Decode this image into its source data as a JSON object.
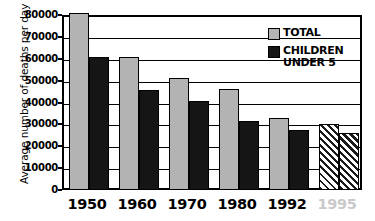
{
  "chart_data": {
    "type": "bar",
    "title": "",
    "xlabel": "",
    "ylabel": "Average number of deaths per day",
    "categories": [
      "1950",
      "1960",
      "1970",
      "1980",
      "1992",
      "1995"
    ],
    "ylim": [
      0,
      80000
    ],
    "ytick_labels": [
      "0",
      "10000",
      "20000",
      "30000",
      "40000",
      "50000",
      "60000",
      "70000",
      "80000"
    ],
    "ytick_values": [
      0,
      10000,
      20000,
      30000,
      40000,
      50000,
      60000,
      70000,
      80000
    ],
    "grid": true,
    "legend_position": "top-right",
    "series": [
      {
        "name": "TOTAL",
        "color": "#b3b3b3",
        "values": [
          81000,
          61000,
          51000,
          46000,
          33000,
          30000
        ]
      },
      {
        "name": "CHILDREN UNDER 5",
        "color": "#151515",
        "values": [
          61000,
          45500,
          40500,
          31500,
          27500,
          26000
        ]
      }
    ],
    "projected_category": "1995",
    "projected_note": "1995 bars drawn with diagonal hatch pattern"
  },
  "axis": {
    "y_title": "Average number of deaths per day"
  },
  "legend": {
    "entries": [
      {
        "label": "TOTAL",
        "swatch": "total"
      },
      {
        "label": "CHILDREN\nUNDER 5",
        "swatch": "children"
      }
    ]
  },
  "colors": {
    "total_fill": "#b3b3b3",
    "children_fill": "#151515",
    "axis": "#000000",
    "projected_label": "#c9c9c9",
    "background": "#ffffff"
  },
  "caption_remnant": ""
}
